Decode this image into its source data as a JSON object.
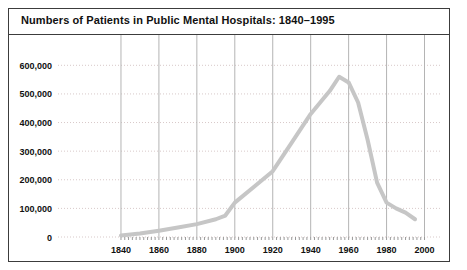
{
  "figure": {
    "title": "Numbers of Patients in Public Mental Hospitals: 1840–1995",
    "border_color": "#3c3c3c",
    "background": "#ffffff"
  },
  "chart_data": {
    "type": "line",
    "title": "Numbers of Patients in Public Mental Hospitals: 1840–1995",
    "xlabel": "",
    "ylabel": "",
    "xlim": [
      1830,
      2005
    ],
    "ylim": [
      0,
      650000
    ],
    "grid": true,
    "legend": null,
    "line_color": "#c6c6c6",
    "line_width": 4,
    "gridline_color": "#b4b4b4",
    "dotted_gridline_color": "#d8c9c9",
    "x_ticks": [
      1840,
      1860,
      1880,
      1900,
      1920,
      1940,
      1960,
      1980,
      2000
    ],
    "x_tick_labels": [
      "1840",
      "1860",
      "1880",
      "1900",
      "1920",
      "1940",
      "1960",
      "1980",
      "2000"
    ],
    "y_ticks": [
      0,
      100000,
      200000,
      300000,
      400000,
      500000,
      600000
    ],
    "y_tick_labels": [
      "0",
      "100,000",
      "200,000",
      "300,000",
      "400,000",
      "500,000",
      "600,000"
    ],
    "series": [
      {
        "name": "Patients in public mental hospitals",
        "x": [
          1840,
          1850,
          1860,
          1870,
          1880,
          1890,
          1895,
          1900,
          1910,
          1920,
          1930,
          1940,
          1945,
          1950,
          1955,
          1960,
          1965,
          1970,
          1975,
          1980,
          1985,
          1990,
          1995
        ],
        "values": [
          5000,
          12000,
          22000,
          33000,
          45000,
          62000,
          75000,
          120000,
          175000,
          230000,
          330000,
          430000,
          470000,
          510000,
          560000,
          540000,
          470000,
          340000,
          190000,
          120000,
          100000,
          85000,
          62000
        ]
      }
    ]
  }
}
